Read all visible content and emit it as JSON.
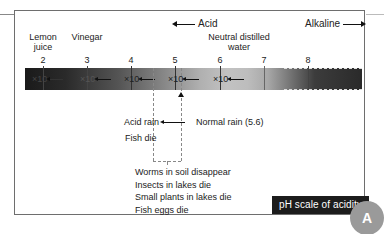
{
  "diagram": {
    "title": "pH scale of acidity",
    "corner_badge": "A",
    "direction_labels": {
      "acid": "Acid",
      "alkaline": "Alkaline"
    },
    "substances": [
      {
        "label_line1": "Lemon",
        "label_line2": "juice",
        "ph": 2
      },
      {
        "label_line1": "Vinegar",
        "label_line2": "",
        "ph": 3
      },
      {
        "label_line1": "Neutral distilled",
        "label_line2": "water",
        "ph": 7
      }
    ],
    "ticks": [
      "2",
      "3",
      "4",
      "5",
      "6",
      "7",
      "8"
    ],
    "multipliers": [
      "×10",
      "×10",
      "×10",
      "×10",
      "×10"
    ],
    "markers": {
      "acid_rain": "Acid rain",
      "normal_rain": "Normal rain (5.6)",
      "fish_die": "Fish die"
    },
    "effects": [
      "Worms in soil disappear",
      "Insects in lakes die",
      "Small plants in lakes die",
      "Fish eggs die"
    ],
    "colors": {
      "bar_dark": "#1a1a1a",
      "bar_light": "#c2c2c2",
      "title_bg": "#1c1c1c",
      "badge_bg": "#9a9a9a",
      "frame": "#6e6e6e"
    }
  }
}
